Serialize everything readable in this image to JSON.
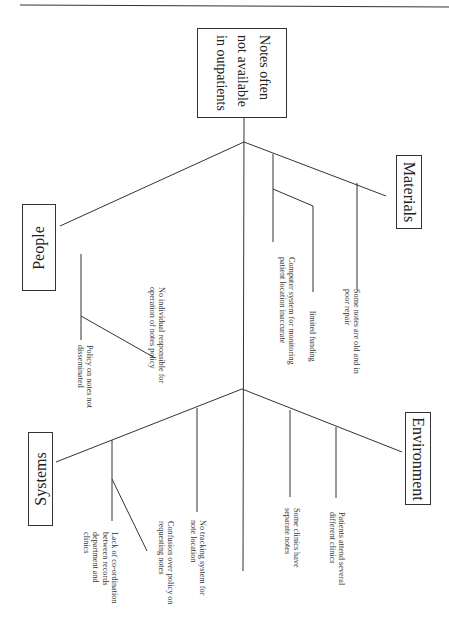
{
  "diagram": {
    "type": "fishbone",
    "effect": {
      "lines": [
        "Notes often",
        "not available",
        "in outpatients"
      ]
    },
    "categories": [
      {
        "id": "people",
        "label": "People",
        "causes": [
          {
            "lines": [
              "Policy on notes not",
              "disseminated"
            ]
          },
          {
            "lines": [
              "No individual responsible for",
              "operation of notes policy"
            ]
          }
        ]
      },
      {
        "id": "materials",
        "label": "Materials",
        "causes": [
          {
            "lines": [
              "Computer system for monitoring",
              "patient location inaccurate"
            ]
          },
          {
            "lines": [
              "limited funding"
            ]
          },
          {
            "lines": [
              "Some notes are old and in",
              "poor repair"
            ]
          }
        ]
      },
      {
        "id": "systems",
        "label": "Systems",
        "causes": [
          {
            "lines": [
              "Lack of co-ordination",
              "between records",
              "department and",
              "clinics"
            ]
          },
          {
            "lines": [
              "Confusion over policy on",
              "requesting notes"
            ]
          },
          {
            "lines": [
              "No tracking system for",
              "note location"
            ]
          }
        ]
      },
      {
        "id": "environment",
        "label": "Environment",
        "causes": [
          {
            "lines": [
              "Some clinics have",
              "separate notes"
            ]
          },
          {
            "lines": [
              "Patients attend several",
              "different clinics"
            ]
          }
        ]
      }
    ]
  },
  "style": {
    "line_color": "#333333",
    "background": "#ffffff"
  }
}
